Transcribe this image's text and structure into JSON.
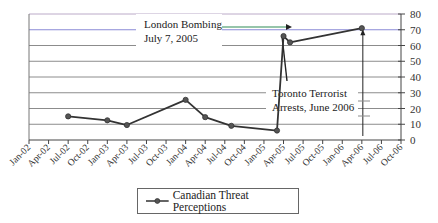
{
  "chart_data": {
    "type": "line",
    "title": "",
    "xlabel": "",
    "ylabel": "",
    "ylim": [
      0,
      80
    ],
    "yticks": [
      0,
      10,
      20,
      30,
      40,
      50,
      60,
      70,
      80
    ],
    "y_axis_position": "right",
    "grid": true,
    "xtick_labels": [
      "Jan-02",
      "Apr-02",
      "Jul-02",
      "Oct-02",
      "Jan-03",
      "Apr-03",
      "Jul-03",
      "Oct-03",
      "Jan-04",
      "Apr-04",
      "Jul-04",
      "Oct-04",
      "Jan-05",
      "Apr-05",
      "Jul-05",
      "Oct-05",
      "Jan-06",
      "Apr-06",
      "Jul-06",
      "Oct-06"
    ],
    "legend_position": "bottom",
    "series": [
      {
        "name": "Canadian Threat Perceptions",
        "color": "#333333",
        "marker": "circle",
        "points": [
          {
            "x": "Jul-02",
            "y": 15
          },
          {
            "x": "Jan-03",
            "y": 12.5
          },
          {
            "x": "Apr-03",
            "y": 9.5
          },
          {
            "x": "Jan-04",
            "y": 25.5
          },
          {
            "x": "Apr-04",
            "y": 14.5
          },
          {
            "x": "Aug-04",
            "y": 9
          },
          {
            "x": "Mar-05",
            "y": 6
          },
          {
            "x": "Apr-05",
            "y": 66
          },
          {
            "x": "May-05",
            "y": 62
          },
          {
            "x": "Apr-06",
            "y": 71
          }
        ]
      }
    ],
    "annotations": [
      {
        "text_lines": [
          "London Bombing",
          "July 7, 2005"
        ],
        "target": "Jul-05",
        "arrow_color": "#2e8b57"
      },
      {
        "text_lines": [
          "Toronto Terrorist",
          "Arrests, June 2006"
        ],
        "target": "Apr-06"
      }
    ]
  },
  "legend": {
    "label": "Canadian Threat Perceptions"
  }
}
